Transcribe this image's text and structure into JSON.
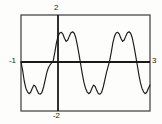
{
  "chart_data": {
    "type": "line",
    "title": "",
    "xlabel": "",
    "ylabel": "",
    "grid": false,
    "legend": null,
    "xlim": [
      -1,
      3
    ],
    "ylim": [
      -2,
      2
    ],
    "axis_labels": {
      "ymax": "2",
      "ymin": "-2",
      "xmin": "-1",
      "xmax": "3"
    },
    "series": [
      {
        "name": "y",
        "x": [
          -1.0,
          -0.95,
          -0.9,
          -0.85,
          -0.8,
          -0.75,
          -0.7,
          -0.65,
          -0.6,
          -0.55,
          -0.5,
          -0.45,
          -0.4,
          -0.35,
          -0.3,
          -0.25,
          -0.2,
          -0.15,
          -0.1,
          -0.05,
          0.0,
          0.05,
          0.1,
          0.15,
          0.2,
          0.25,
          0.3,
          0.35,
          0.4,
          0.45,
          0.5,
          0.55,
          0.6,
          0.65,
          0.7,
          0.75,
          0.8,
          0.85,
          0.9,
          0.95,
          1.0,
          1.05,
          1.1,
          1.15,
          1.2,
          1.25,
          1.3,
          1.35,
          1.4,
          1.45,
          1.5,
          1.55,
          1.6,
          1.65,
          1.7,
          1.75,
          1.8,
          1.85,
          1.9,
          1.95,
          2.0,
          2.05,
          2.1,
          2.15,
          2.2,
          2.25,
          2.3,
          2.35,
          2.4,
          2.45,
          2.5,
          2.55,
          2.6,
          2.65,
          2.7,
          2.75,
          2.8,
          2.85,
          2.9,
          2.95,
          3.0
        ],
        "y": [
          0.05,
          -0.3,
          -0.75,
          -1.05,
          -1.2,
          -1.28,
          -1.22,
          -1.05,
          -0.92,
          -0.98,
          -1.15,
          -1.28,
          -1.3,
          -1.22,
          -1.0,
          -0.7,
          -0.4,
          -0.2,
          -0.08,
          0.0,
          0.1,
          0.45,
          0.85,
          1.12,
          1.25,
          1.28,
          1.2,
          1.02,
          0.9,
          0.96,
          1.12,
          1.26,
          1.3,
          1.24,
          1.05,
          0.72,
          0.35,
          -0.05,
          -0.45,
          -0.8,
          -1.05,
          -1.2,
          -1.28,
          -1.22,
          -1.05,
          -0.92,
          -0.98,
          -1.15,
          -1.28,
          -1.3,
          -1.22,
          -1.0,
          -0.7,
          -0.4,
          -0.15,
          0.1,
          0.45,
          0.85,
          1.12,
          1.25,
          1.28,
          1.2,
          1.02,
          0.9,
          0.96,
          1.12,
          1.26,
          1.3,
          1.24,
          1.05,
          0.72,
          0.35,
          -0.05,
          -0.45,
          -0.8,
          -1.05,
          -1.2,
          -1.28,
          -1.22,
          -1.05,
          -0.92
        ]
      }
    ],
    "colors": {
      "curve": "#1a1a1a",
      "axis": "#1a1a1a",
      "frame": "#4a4a4a",
      "background": "#fdfdfc"
    }
  },
  "viewport": {
    "frame": {
      "left": 21,
      "top": 15,
      "right": 150,
      "bottom": 111
    },
    "origin": {
      "x": 58,
      "y": 62
    }
  }
}
